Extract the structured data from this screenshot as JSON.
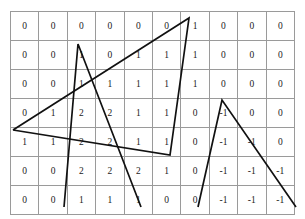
{
  "figure": {
    "grid_color": "#9a9a9a",
    "border_color": "#3a3a3a",
    "line_color": "#111111",
    "background": "#ffffff"
  },
  "chart_data": {
    "type": "heatmap",
    "title": "",
    "xlabel": "",
    "ylabel": "",
    "grid": true,
    "legend": "none",
    "rows": 7,
    "columns": 10,
    "cell_text_rows": [
      [
        "0",
        "0",
        "0",
        "0",
        "0",
        "0",
        "1",
        "0",
        "0",
        "0"
      ],
      [
        "0",
        "0",
        "1",
        "0",
        "1",
        "1",
        "1",
        "0",
        "0",
        "0"
      ],
      [
        "0",
        "0",
        "1",
        "1",
        "1",
        "1",
        "1",
        "0",
        "0",
        "0"
      ],
      [
        "0",
        "1",
        "2",
        "2",
        "1",
        "1",
        "0",
        "-1",
        "0",
        "0"
      ],
      [
        "1",
        "1",
        "2",
        "2",
        "1",
        "1",
        "0",
        "-1",
        "-1",
        "0"
      ],
      [
        "0",
        "0",
        "2",
        "2",
        "2",
        "1",
        "0",
        "-1",
        "-1",
        "-1"
      ],
      [
        "0",
        "0",
        "1",
        "1",
        "1",
        "0",
        "0",
        "-1",
        "-1",
        "-1"
      ]
    ],
    "values": [
      [
        0,
        0,
        0,
        0,
        0,
        0,
        1,
        0,
        0,
        0
      ],
      [
        0,
        0,
        1,
        0,
        1,
        1,
        1,
        0,
        0,
        0
      ],
      [
        0,
        0,
        1,
        1,
        1,
        1,
        1,
        0,
        0,
        0
      ],
      [
        0,
        1,
        2,
        2,
        1,
        1,
        0,
        -1,
        0,
        0
      ],
      [
        1,
        1,
        2,
        2,
        1,
        1,
        0,
        -1,
        -1,
        0
      ],
      [
        0,
        0,
        2,
        2,
        2,
        1,
        0,
        -1,
        -1,
        -1
      ],
      [
        0,
        0,
        1,
        1,
        1,
        0,
        0,
        -1,
        -1,
        -1
      ]
    ],
    "value_range": [
      -1,
      2
    ],
    "series": [
      {
        "name": "polyline-1",
        "points": [
          [
            13,
            130
          ],
          [
            189,
            18
          ],
          [
            170,
            155
          ],
          [
            13,
            130
          ]
        ]
      },
      {
        "name": "polyline-2",
        "points": [
          [
            64,
            207
          ],
          [
            78,
            44
          ],
          [
            141,
            207
          ]
        ]
      },
      {
        "name": "polyline-3",
        "points": [
          [
            198,
            207
          ],
          [
            222,
            100
          ],
          [
            296,
            207
          ]
        ]
      }
    ]
  }
}
